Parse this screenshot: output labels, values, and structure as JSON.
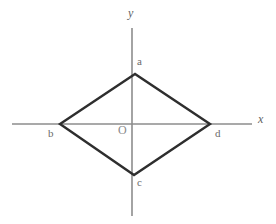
{
  "figure": {
    "kind": "coordinate-plane-rhombus-diagram",
    "background_color": "#ffffff",
    "axis_color": "#8d8d8d",
    "shape_color": "#2e2e2e",
    "label_color": "#6f6f6f",
    "width": 276,
    "height": 224
  },
  "axes": {
    "x": {
      "label": "x",
      "x1": 12,
      "y1": 124,
      "x2": 252,
      "y2": 124
    },
    "y": {
      "label": "y",
      "x1": 132,
      "y1": 28,
      "x2": 132,
      "y2": 216
    },
    "origin": {
      "label": "O",
      "x": 132,
      "y": 124
    }
  },
  "shape": {
    "name": "rhombus",
    "closed": true,
    "vertices": [
      {
        "label": "a",
        "x": 135,
        "y": 74,
        "position": "top"
      },
      {
        "label": "b",
        "x": 60,
        "y": 124,
        "position": "left"
      },
      {
        "label": "c",
        "x": 134,
        "y": 175,
        "position": "bottom"
      },
      {
        "label": "d",
        "x": 210,
        "y": 124,
        "position": "right"
      }
    ],
    "path": "M135,74 L60,124 L134,175 L210,124 Z"
  },
  "chart_data": {
    "type": "scatter",
    "title": "",
    "xlabel": "x",
    "ylabel": "y",
    "grid": false,
    "legend": null,
    "annotations": [
      "a",
      "b",
      "c",
      "d",
      "O"
    ],
    "series": [
      {
        "name": "rhombus abcd",
        "points": [
          {
            "label": "a",
            "px": 135,
            "py": 74
          },
          {
            "label": "b",
            "px": 60,
            "py": 124
          },
          {
            "label": "c",
            "px": 134,
            "py": 175
          },
          {
            "label": "d",
            "px": 210,
            "py": 124
          }
        ]
      }
    ]
  }
}
